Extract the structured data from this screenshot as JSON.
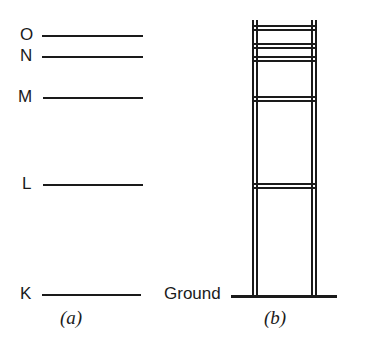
{
  "figure": {
    "background_color": "#ffffff",
    "stroke_color": "#1a1a1a"
  },
  "panel_a": {
    "caption": "(a)",
    "caption_x": 60,
    "caption_y": 308,
    "levels": [
      {
        "name": "energy-level-O",
        "label": "O",
        "label_x": 20,
        "label_y": 26,
        "line_x1": 42,
        "line_x2": 143,
        "line_y": 36
      },
      {
        "name": "energy-level-N",
        "label": "N",
        "label_x": 20,
        "label_y": 47,
        "line_x1": 42,
        "line_x2": 143,
        "line_y": 57
      },
      {
        "name": "energy-level-M",
        "label": "M",
        "label_x": 18,
        "label_y": 88,
        "line_x1": 43,
        "line_x2": 143,
        "line_y": 98
      },
      {
        "name": "energy-level-L",
        "label": "L",
        "label_x": 22,
        "label_y": 175,
        "line_x1": 43,
        "line_x2": 143,
        "line_y": 185
      },
      {
        "name": "energy-level-K",
        "label": "K",
        "label_x": 20,
        "label_y": 285,
        "line_x1": 42,
        "line_x2": 141,
        "line_y": 295
      }
    ]
  },
  "panel_b": {
    "caption": "(b)",
    "caption_x": 264,
    "caption_y": 308,
    "ground_label": "Ground",
    "ground_label_x": 164,
    "ground_label_y": 285,
    "ground_line": {
      "x1": 231,
      "x2": 337,
      "y": 296,
      "width": 3
    },
    "rails": [
      {
        "name": "ladder-rail-left-outer",
        "x": 253,
        "y_top": 20,
        "y_bottom": 296
      },
      {
        "name": "ladder-rail-left-inner",
        "x": 257,
        "y_top": 20,
        "y_bottom": 296
      },
      {
        "name": "ladder-rail-right-inner",
        "x": 312,
        "y_top": 20,
        "y_bottom": 296
      },
      {
        "name": "ladder-rail-right-outer",
        "x": 316,
        "y_top": 20,
        "y_bottom": 296
      }
    ],
    "rungs": [
      {
        "name": "ladder-rung-O",
        "y_upper": 26,
        "y_lower": 30,
        "x1": 253,
        "x2": 316
      },
      {
        "name": "ladder-rung-N",
        "y_upper": 44,
        "y_lower": 48,
        "x1": 253,
        "x2": 316
      },
      {
        "name": "ladder-rung-divider",
        "y_upper": 57,
        "y_lower": 61,
        "x1": 253,
        "x2": 316
      },
      {
        "name": "ladder-rung-M",
        "y_upper": 97,
        "y_lower": 101,
        "x1": 253,
        "x2": 316
      },
      {
        "name": "ladder-rung-L",
        "y_upper": 184,
        "y_lower": 188,
        "x1": 253,
        "x2": 316
      }
    ]
  }
}
